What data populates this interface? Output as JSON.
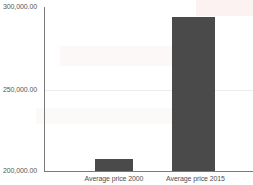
{
  "chart_data": {
    "type": "bar",
    "title": "",
    "subtitle": "",
    "xlabel": "",
    "ylabel": "",
    "categories": [
      "Average price 2000",
      "Average price 2015"
    ],
    "values": [
      207400,
      293800
    ],
    "series": [
      {
        "name": "Average price",
        "values": [
          207400,
          293800
        ],
        "color": "#4a4a4a"
      }
    ],
    "ylim": [
      200000,
      300000
    ],
    "yticks": [
      200000,
      250000,
      300000
    ],
    "ytick_labels": [
      "200,000.00",
      "250,000.00",
      "300,000.00"
    ],
    "grid": "horizontal-faint",
    "gridlines_at": [
      250000
    ],
    "legend": "none",
    "legend_position": "none",
    "annotations": []
  },
  "axis": {
    "y": {
      "ticks": [
        {
          "label": "300,000.00",
          "value": 300000
        },
        {
          "label": "250,000.00",
          "value": 250000
        },
        {
          "label": "200,000.00",
          "value": 200000
        }
      ]
    },
    "x": {
      "ticks": [
        {
          "label": "Average price 2000"
        },
        {
          "label": "Average price 2015"
        }
      ]
    }
  },
  "colors": {
    "bar": "#4a4a4a",
    "axis": "#7a7a7a",
    "gridline": "#ececec",
    "tick_text": "#575757",
    "category_text": "#4f4f4f",
    "background": "#ffffff"
  }
}
